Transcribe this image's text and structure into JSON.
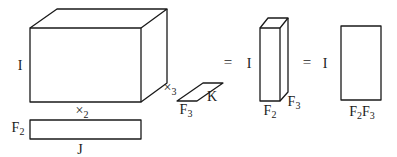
{
  "diagram": {
    "stroke_color": "#1a1a1a",
    "background": "#ffffff",
    "tensor_cube": {
      "height_label": "I",
      "width_label": "×",
      "width_sub": "2",
      "depth_label": "×",
      "depth_sub": "3"
    },
    "factor_F2": {
      "left_label": "F",
      "left_sub": "2",
      "bottom_label": "J"
    },
    "factor_F3": {
      "bottom_label": "F",
      "bottom_sub": "3",
      "right_label": "K"
    },
    "equals_1": "=",
    "result_box": {
      "height_label": "I",
      "width_label": "F",
      "width_sub": "2",
      "depth_label": "F",
      "depth_sub": "3"
    },
    "equals_2": "=",
    "result_matrix": {
      "height_label": "I",
      "bottom_label_a": "F",
      "bottom_sub_a": "2",
      "bottom_label_b": "F",
      "bottom_sub_b": "3"
    }
  }
}
